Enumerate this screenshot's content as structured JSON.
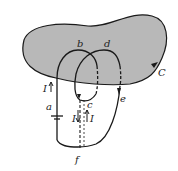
{
  "diagram": {
    "colors": {
      "surface": "#b8b8b8",
      "stroke": "#1a1a1a",
      "background": "#ffffff"
    },
    "labels": {
      "curve": "C",
      "a": "a",
      "b": "b",
      "c": "c",
      "d": "d",
      "e": "e",
      "f": "f",
      "current_left": "I",
      "current_mid_down": "I",
      "current_mid_up": "I"
    }
  }
}
